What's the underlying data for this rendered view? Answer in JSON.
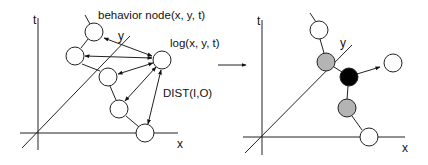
{
  "left_panel": {
    "axis_labels": {
      "t": "t",
      "x": "x",
      "y": "y"
    },
    "annotations": {
      "behavior_node": "behavior node(x, y, t)",
      "log": "log(x, y, t)",
      "dist": "DIST(I,O)"
    }
  },
  "transition_arrow": "→",
  "right_panel": {
    "axis_labels": {
      "t": "t",
      "x": "x",
      "y": "y"
    },
    "node_colors": {
      "white": "#ffffff",
      "gray": "#b4b4b4",
      "black": "#000000"
    }
  }
}
